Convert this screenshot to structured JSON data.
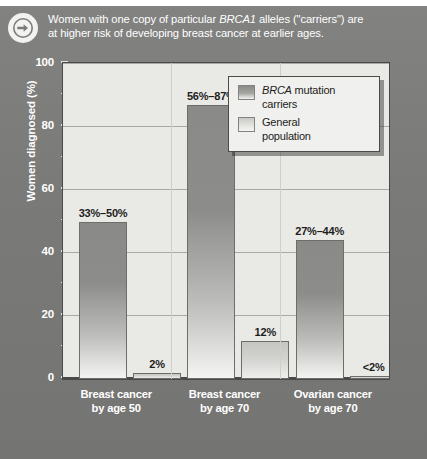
{
  "caption": {
    "icon": "arrow-right-circle-icon",
    "line1_pre": "Women with one copy of particular ",
    "line1_em": "BRCA1",
    "line1_post": " alleles (\"carriers\") are",
    "line2": "at higher risk of developing breast cancer at earlier ages."
  },
  "legend": {
    "items": [
      {
        "em": "BRCA",
        "rest": " mutation",
        "line2": "carriers",
        "swatch": "carrier"
      },
      {
        "em": "",
        "rest": "General",
        "line2": "population",
        "swatch": "general"
      }
    ]
  },
  "colors": {
    "panel": "#7b7b79",
    "plot_background": "#e9e9e6",
    "frame": "#4a4a48",
    "gridline": "#b9b9b4",
    "carrier_bar_top": "#8a8a88",
    "general_bar_top": "#c5c5c2",
    "caption_text": "#ffffff",
    "axis_text": "#ffffff",
    "label_text": "#1d1d1b"
  },
  "chart_data": {
    "type": "bar",
    "title": "",
    "xlabel": "",
    "ylabel": "Women diagnosed (%)",
    "ylim": [
      0,
      100
    ],
    "yticks": [
      0,
      20,
      40,
      60,
      80,
      100
    ],
    "ytick_labels": [
      "0",
      "20",
      "40",
      "60",
      "80",
      "100"
    ],
    "yminor_ticks": [
      10,
      30,
      50,
      70,
      90
    ],
    "grid": true,
    "legend_position": "top-right",
    "categories": [
      "Breast cancer\nby age 50",
      "Breast cancer\nby age 70",
      "Ovarian cancer\nby age 70"
    ],
    "category_lines": [
      [
        "Breast cancer",
        "by age 50"
      ],
      [
        "Breast cancer",
        "by age 70"
      ],
      [
        "Ovarian cancer",
        "by age 70"
      ]
    ],
    "series": [
      {
        "name": "BRCA mutation carriers",
        "values": [
          50,
          87,
          44
        ],
        "range_low": [
          33,
          56,
          27
        ],
        "range_high": [
          50,
          87,
          44
        ],
        "labels": [
          "33%–50%",
          "56%–87%",
          "27%–44%"
        ]
      },
      {
        "name": "General population",
        "values": [
          2,
          12,
          1
        ],
        "labels": [
          "2%",
          "12%",
          "<2%"
        ]
      }
    ]
  }
}
